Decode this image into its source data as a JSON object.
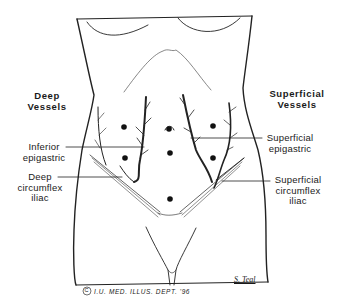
{
  "figure": {
    "groups": {
      "left_heading": [
        "Deep",
        "Vessels"
      ],
      "right_heading": [
        "Superficial",
        "Vessels"
      ]
    },
    "labels": {
      "inferior_epigastric": [
        "Inferior",
        "epigastric"
      ],
      "deep_circumflex_iliac": [
        "Deep",
        "circumflex",
        "iliac"
      ],
      "superficial_epigastric": [
        "Superficial",
        "epigastric"
      ],
      "superficial_circumflex_iliac": [
        "Superficial",
        "circumflex",
        "iliac"
      ]
    },
    "signature": "S. Teal",
    "credit": "I.U. MED. ILLUS. DEPT. '96",
    "copyright_symbol": "C"
  }
}
